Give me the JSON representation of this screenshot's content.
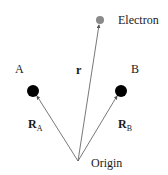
{
  "diagram": {
    "title": "",
    "colors": {
      "background": "#ffffff",
      "vector": "#555555",
      "nucleus": "#000000",
      "electron": "#8a8a8a",
      "text": "#1a1a1a"
    },
    "origin": {
      "label": "Origin",
      "x": 78,
      "y": 161
    },
    "nuclei": [
      {
        "id": "A",
        "label": "A",
        "x": 33,
        "y": 91,
        "r": 6
      },
      {
        "id": "B",
        "label": "B",
        "x": 121,
        "y": 91,
        "r": 6
      }
    ],
    "electron": {
      "label": "Electron",
      "x": 100,
      "y": 20,
      "r": 4
    },
    "vectors": [
      {
        "id": "RA",
        "symbol": "R",
        "subscript": "A",
        "from": "origin",
        "to": "A"
      },
      {
        "id": "RB",
        "symbol": "R",
        "subscript": "B",
        "from": "origin",
        "to": "B"
      },
      {
        "id": "r",
        "symbol": "r",
        "subscript": "",
        "from": "origin",
        "to": "electron"
      }
    ]
  }
}
